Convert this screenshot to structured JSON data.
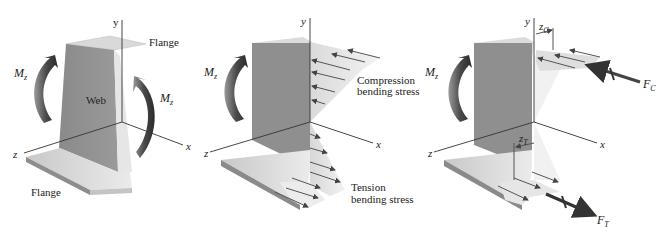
{
  "panels": [
    {
      "id": "panel-1",
      "labels": {
        "y_axis": "y",
        "x_axis": "x",
        "z_axis": "z",
        "flange_top": "Flange",
        "flange_bottom": "Flange",
        "web": "Web",
        "moment_left": "M",
        "moment_left_sub": "z",
        "moment_right": "M",
        "moment_right_sub": "z"
      }
    },
    {
      "id": "panel-2",
      "labels": {
        "y_axis": "y",
        "x_axis": "x",
        "z_axis": "z",
        "moment": "M",
        "moment_sub": "z",
        "compression_line1": "Compression",
        "compression_line2": "bending stress",
        "tension_line1": "Tension",
        "tension_line2": "bending stress"
      }
    },
    {
      "id": "panel-3",
      "labels": {
        "y_axis": "y",
        "x_axis": "x",
        "z_axis": "z",
        "moment": "M",
        "moment_sub": "z",
        "zc": "z",
        "zc_sub": "C",
        "zt": "z",
        "zt_sub": "T",
        "fc": "F",
        "fc_sub": "C",
        "ft": "F",
        "ft_sub": "T"
      }
    }
  ],
  "colors": {
    "web": "#8e8e8e",
    "web_dark": "#7a7a7a",
    "flange_top": "#d2d2d2",
    "flange_side": "#a8a8a8",
    "stress_fill": "#e4e4e4",
    "moment_arrow": "#555555",
    "force_arrow": "#444444"
  }
}
